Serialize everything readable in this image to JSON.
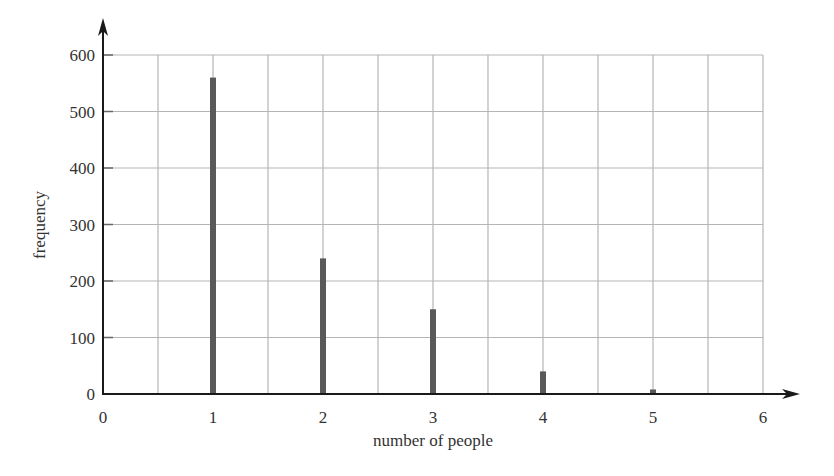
{
  "chart_data": {
    "type": "bar",
    "title": "",
    "xlabel": "number of people",
    "ylabel": "frequency",
    "categories": [
      1,
      2,
      3,
      4,
      5
    ],
    "values": [
      560,
      240,
      150,
      40,
      8
    ],
    "x_ticks": [
      "0",
      "1",
      "2",
      "3",
      "4",
      "5",
      "6"
    ],
    "y_ticks": [
      "0",
      "100",
      "200",
      "300",
      "400",
      "500",
      "600"
    ],
    "xlim": [
      0,
      6
    ],
    "ylim": [
      0,
      600
    ],
    "grid": true,
    "grid_x_step": 0.5,
    "grid_y_step": 100,
    "legend": null,
    "bar_style": "vertical line bars"
  },
  "colors": {
    "bar": "#595959",
    "grid": "#b5b5b5",
    "axis": "#1a1a1a",
    "text": "#333333"
  }
}
